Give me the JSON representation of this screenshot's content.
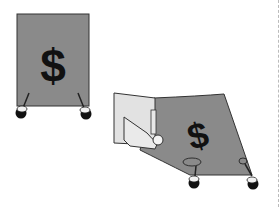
{
  "illustration": {
    "card_one": {
      "symbol": "$",
      "state": "pinned"
    },
    "card_two": {
      "symbol": "$",
      "state": "being pulled by hand"
    },
    "colors": {
      "card": "#8a8a8a",
      "outline": "#333333",
      "symbol": "#111111",
      "hand": "#e2e2e2",
      "pin_head": "#111111",
      "pin_cap": "#f2f2f2"
    }
  }
}
